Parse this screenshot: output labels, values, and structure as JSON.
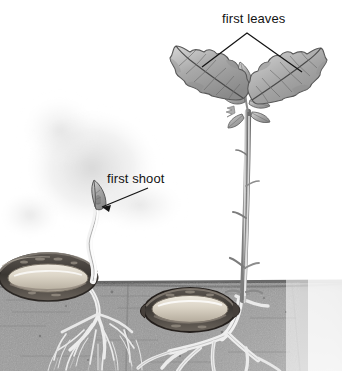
{
  "figure": {
    "medium": "pencil-shaded botanical drawing",
    "background_color": "#ffffff",
    "ink_color": "#131313",
    "soil_color": "#8e8e8e",
    "seed_husk_color": "#4a4643",
    "seed_flesh_color": "#cfc9bd",
    "foliage_color": "#9a9a9a"
  },
  "labels": [
    {
      "id": "first-leaves",
      "text": "first leaves",
      "x": 222,
      "y": 12,
      "leader": "bracket",
      "points_to": [
        "left oak leaf",
        "right oak leaf"
      ]
    },
    {
      "id": "first-shoot",
      "text": "first shoot",
      "x": 107,
      "y": 172,
      "leader": "arrow",
      "points_to": [
        "shoot tip leaf of left seedling"
      ]
    },
    {
      "id": "first-root",
      "text": "ot",
      "full_text_clipped": "first root",
      "x": -16,
      "y": 220,
      "leader": "none",
      "note": "label is cropped at the left edge of the frame"
    }
  ],
  "scene": {
    "ground_line_y": 282,
    "stages": [
      {
        "id": "early-seedling",
        "position": "left",
        "seed": {
          "cx": 48,
          "cy": 277,
          "rx": 48,
          "ry": 23,
          "split_husk": true
        },
        "shoot": {
          "visible": true,
          "tip_x": 97,
          "tip_y": 205,
          "leaf_count": 1
        },
        "roots": {
          "visible": true,
          "type": "fine fibrous",
          "spread": "wide"
        },
        "leaves_above_soil": 0
      },
      {
        "id": "young-sapling",
        "position": "right",
        "seed": {
          "cx": 190,
          "cy": 310,
          "rx": 45,
          "ry": 21,
          "split_husk": true
        },
        "stem": {
          "base_x": 243,
          "base_y": 285,
          "top_x": 248,
          "top_y": 108
        },
        "roots": {
          "visible": true,
          "type": "thick taproot and laterals",
          "spread": "wide"
        },
        "leaves_above_soil": 2,
        "leaf_positions": [
          {
            "side": "left",
            "cx": 200,
            "cy": 80
          },
          {
            "side": "right",
            "cx": 300,
            "cy": 85
          }
        ],
        "crown_leaflets": 6
      }
    ]
  }
}
